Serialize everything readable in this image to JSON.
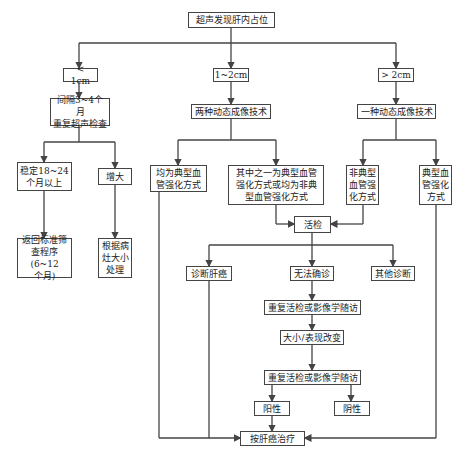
{
  "diagram": {
    "type": "flowchart",
    "colors": {
      "line": "#444444",
      "box_border": "#444444",
      "text": "#222222",
      "background": "#ffffff"
    },
    "nodes": {
      "root": "超声发现肝内占位",
      "lt1": "< 1cm",
      "mid": "1~2cm",
      "gt2": "> 2cm",
      "interval": "间隔3~4个月\n重复超声检查",
      "two_tech": "两种动态成像技术",
      "one_tech": "一种动态成像技术",
      "stable": "稳定18~24\n个月以上",
      "enlarge": "增大",
      "both_typical": "均为典型血\n管强化方式",
      "one_typical": "其中之一为典型血管\n强化方式或均为非典\n型血管强化方式",
      "atypical": "非典型\n血管强\n化方式",
      "typical": "典型血\n管强化\n方式",
      "return_screen": "返回标准筛\n查程序(6~12\n个月)",
      "by_size": "根据病\n灶大小\n处理",
      "biopsy": "活检",
      "diag_hcc": "诊断肝癌",
      "undetermined": "无法确诊",
      "other_diag": "其他诊断",
      "repeat1": "重复活检或影像学随访",
      "change": "大小/表现改变",
      "repeat2": "重复活检或影像学随访",
      "positive": "阳性",
      "negative": "阴性",
      "treat": "按肝癌治疗"
    }
  }
}
